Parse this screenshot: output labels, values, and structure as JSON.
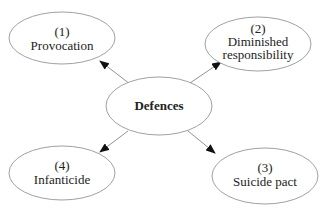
{
  "diagram": {
    "center": {
      "label": "Defences"
    },
    "nodes": [
      {
        "number": "(1)",
        "lines": [
          "Provocation"
        ]
      },
      {
        "number": "(2)",
        "lines": [
          "Diminished",
          "responsibility"
        ]
      },
      {
        "number": "(3)",
        "lines": [
          "Suicide pact"
        ]
      },
      {
        "number": "(4)",
        "lines": [
          "Infanticide"
        ]
      }
    ],
    "edges": [
      {
        "from": "Defences",
        "to": "(1) Provocation"
      },
      {
        "from": "Defences",
        "to": "(2) Diminished responsibility"
      },
      {
        "from": "Defences",
        "to": "(3) Suicide pact"
      },
      {
        "from": "Defences",
        "to": "(4) Infanticide"
      }
    ],
    "colors": {
      "stroke": "#888888",
      "arrow": "#111111",
      "text": "#222222"
    }
  }
}
